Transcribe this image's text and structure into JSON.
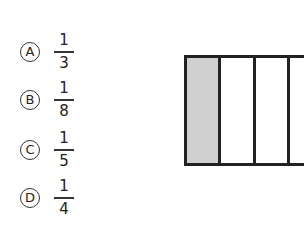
{
  "options": [
    {
      "letter": "A",
      "numerator": "1",
      "denominator": "3"
    },
    {
      "letter": "B",
      "numerator": "1",
      "denominator": "8"
    },
    {
      "letter": "C",
      "numerator": "1",
      "denominator": "5"
    },
    {
      "letter": "D",
      "numerator": "1",
      "denominator": "4"
    }
  ],
  "figure": {
    "parts_visible": 3,
    "shaded_parts": 1,
    "shade_color": "#d0d0d0"
  }
}
